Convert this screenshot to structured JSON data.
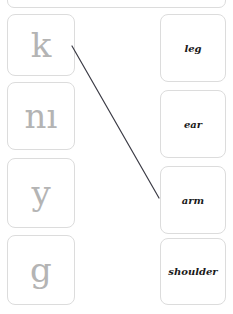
{
  "exercise": {
    "type": "matching-pairs",
    "top_panel": {
      "visible": true,
      "label": ""
    },
    "left_column": {
      "name": "symbols",
      "items": [
        {
          "id": "sym-k",
          "glyph": "k"
        },
        {
          "id": "sym-ni",
          "glyph": "nı"
        },
        {
          "id": "sym-y",
          "glyph": "y"
        },
        {
          "id": "sym-g",
          "glyph": "g"
        }
      ]
    },
    "right_column": {
      "name": "words",
      "items": [
        {
          "id": "word-leg",
          "label": "leg"
        },
        {
          "id": "word-ear",
          "label": "ear"
        },
        {
          "id": "word-arm",
          "label": "arm"
        },
        {
          "id": "word-shoulder",
          "label": "shoulder"
        }
      ]
    },
    "connections": [
      {
        "from": "sym-k",
        "to": "word-arm",
        "x1": 72,
        "y1": 46,
        "x2": 159,
        "y2": 198
      }
    ],
    "colors": {
      "tile_border": "#dcdcdc",
      "tile_background": "#ffffff",
      "glyph": "#b4b4b4",
      "word": "#1a1a1a",
      "connector": "#3c3c46",
      "page_background": "#ffffff"
    }
  }
}
